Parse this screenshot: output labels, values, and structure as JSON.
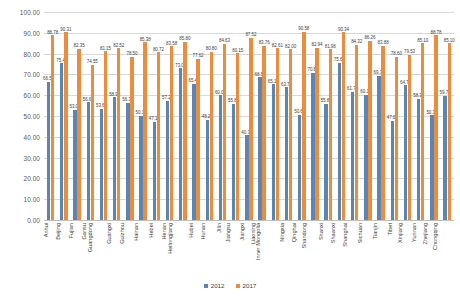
{
  "chart_data": {
    "type": "bar",
    "title": "",
    "subtitle": "",
    "xlabel": "",
    "ylabel": "",
    "ylim": [
      0,
      100
    ],
    "ytick_labels": [
      "100.00",
      "90.00",
      "80.00",
      "70.00",
      "60.00",
      "50.00",
      "40.00",
      "30.00",
      "20.00",
      "10.00",
      "0.00"
    ],
    "ytick_values": [
      100,
      90,
      80,
      70,
      60,
      50,
      40,
      30,
      20,
      10,
      0
    ],
    "grid": true,
    "grid_axis": "y",
    "legend_position": "bottom",
    "colors": {
      "2012": "#5b86b4",
      "2017": "#ed8c3c"
    },
    "categories": [
      "Anhui",
      "Beijing",
      "Fujian",
      "Gansu",
      "Guangdong",
      "Guangxi",
      "Guizhou",
      "Hainan",
      "Hebei",
      "Henan",
      "Heilongjiang",
      "Hubei",
      "Hunan",
      "Jilin",
      "Jiangsu",
      "Jiangxi",
      "Liaoning",
      "Inner Mongolia",
      "Ningxia",
      "Qinghai",
      "Shandong",
      "Shanxi",
      "Shaanxi",
      "Shanghai",
      "Sichuan",
      "Tianjin",
      "Tibet",
      "Xinjiang",
      "Yunnan",
      "Zhejiang",
      "Chongqing"
    ],
    "series": [
      {
        "name": "2012",
        "color": "#5b86b4",
        "values": [
          66.57,
          75.4,
          53.04,
          56.6,
          53.6,
          58.93,
          56.38,
          50.1,
          47.19,
          57.29,
          73.02,
          65.49,
          48.2,
          60.07,
          55.88,
          40.7,
          68.55,
          65.18,
          63.73,
          50.6,
          70.82,
          55.8,
          75.64,
          61.7,
          60.16,
          69.35,
          47.64,
          64.78,
          58.37,
          50.36,
          59.78
        ]
      },
      {
        "name": "2017",
        "color": "#ed8c3c",
        "values": [
          88.78,
          90.31,
          82.35,
          74.55,
          81.15,
          82.52,
          78.5,
          85.38,
          80.72,
          83.58,
          85.8,
          77.62,
          80.8,
          84.63,
          80.15,
          87.52,
          83.76,
          82.61,
          82.0,
          90.58,
          82.94,
          81.98,
          90.34,
          84.32,
          86.26,
          83.88,
          78.6,
          79.53,
          85.1,
          88.78,
          85.1
        ]
      }
    ],
    "data_labels": {
      "2012": [
        "66.57",
        "75.40",
        "53.04",
        "56.60",
        "53.60",
        "58.93",
        "56.38",
        "50.10",
        "47.19",
        "57.29",
        "73.02",
        "65.49",
        "48.20",
        "60.07",
        "55.88",
        "40.70",
        "68.55",
        "65.18",
        "63.73",
        "50.60",
        "70.82",
        "55.80",
        "75.64",
        "61.70",
        "60.16",
        "69.35",
        "47.64",
        "64.78",
        "58.37",
        "50.36",
        "59.78"
      ],
      "2017": [
        "88.78",
        "90.31",
        "82.35",
        "74.55",
        "81.15",
        "82.52",
        "78.50",
        "85.38",
        "80.72",
        "83.58",
        "85.80",
        "77.62",
        "80.80",
        "84.63",
        "80.15",
        "87.52",
        "83.76",
        "82.61",
        "82.00",
        "90.58",
        "82.94",
        "81.98",
        "90.34",
        "84.32",
        "86.26",
        "83.88",
        "78.60",
        "79.53",
        "85.10",
        "88.78",
        "85.10"
      ]
    }
  },
  "legend": {
    "items": [
      {
        "label": "2012",
        "color": "#5b86b4"
      },
      {
        "label": "2017",
        "color": "#ed8c3c"
      }
    ]
  }
}
